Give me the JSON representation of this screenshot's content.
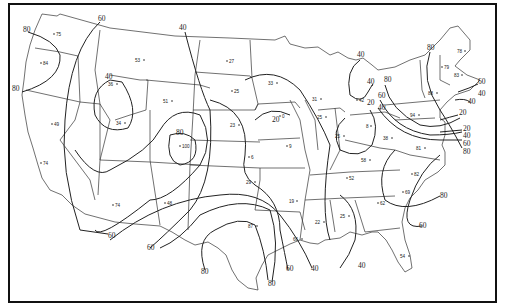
{
  "map": {
    "type": "isoline-map",
    "region": "Contiguous United States",
    "colors": {
      "background": "#ffffff",
      "lines": "#222222",
      "border": "#111111"
    },
    "isoline_labels": [
      {
        "text": "80",
        "x": 23,
        "y": 32
      },
      {
        "text": "60",
        "x": 102,
        "y": 21
      },
      {
        "text": "80",
        "x": 15,
        "y": 91
      },
      {
        "text": "40",
        "x": 183,
        "y": 30
      },
      {
        "text": "40",
        "x": 108,
        "y": 79
      },
      {
        "text": "80",
        "x": 180,
        "y": 135
      },
      {
        "text": "20",
        "x": 275,
        "y": 122
      },
      {
        "text": "40",
        "x": 360,
        "y": 57
      },
      {
        "text": "40",
        "x": 370,
        "y": 84
      },
      {
        "text": "20",
        "x": 370,
        "y": 105
      },
      {
        "text": "40",
        "x": 381,
        "y": 110
      },
      {
        "text": "60",
        "x": 381,
        "y": 98
      },
      {
        "text": "80",
        "x": 387,
        "y": 82
      },
      {
        "text": "80",
        "x": 430,
        "y": 50
      },
      {
        "text": "60",
        "x": 479,
        "y": 84
      },
      {
        "text": "40",
        "x": 480,
        "y": 96
      },
      {
        "text": "40",
        "x": 470,
        "y": 104
      },
      {
        "text": "20",
        "x": 459,
        "y": 115
      },
      {
        "text": "20",
        "x": 463,
        "y": 130
      },
      {
        "text": "40",
        "x": 463,
        "y": 137
      },
      {
        "text": "60",
        "x": 463,
        "y": 145
      },
      {
        "text": "80",
        "x": 463,
        "y": 153
      },
      {
        "text": "80",
        "x": 442,
        "y": 196
      },
      {
        "text": "60",
        "x": 111,
        "y": 237
      },
      {
        "text": "60",
        "x": 151,
        "y": 249
      },
      {
        "text": "80",
        "x": 203,
        "y": 272
      },
      {
        "text": "80",
        "x": 272,
        "y": 284
      },
      {
        "text": "60",
        "x": 289,
        "y": 270
      },
      {
        "text": "40",
        "x": 314,
        "y": 270
      },
      {
        "text": "40",
        "x": 361,
        "y": 266
      },
      {
        "text": "60",
        "x": 422,
        "y": 226
      }
    ],
    "station_values": [
      {
        "value": "75",
        "x": 56,
        "y": 35
      },
      {
        "value": "84",
        "x": 43,
        "y": 64
      },
      {
        "value": "53",
        "x": 137,
        "y": 61
      },
      {
        "value": "27",
        "x": 228,
        "y": 62
      },
      {
        "value": "36",
        "x": 110,
        "y": 85
      },
      {
        "value": "51",
        "x": 165,
        "y": 102
      },
      {
        "value": "25",
        "x": 233,
        "y": 92
      },
      {
        "value": "33",
        "x": 270,
        "y": 84
      },
      {
        "value": "31",
        "x": 315,
        "y": 99
      },
      {
        "value": "42",
        "x": 358,
        "y": 100
      },
      {
        "value": "49",
        "x": 54,
        "y": 124
      },
      {
        "value": "34",
        "x": 119,
        "y": 123
      },
      {
        "value": "23",
        "x": 233,
        "y": 125
      },
      {
        "value": "0",
        "x": 282,
        "y": 116
      },
      {
        "value": "25",
        "x": 320,
        "y": 117
      },
      {
        "value": "8",
        "x": 369,
        "y": 126
      },
      {
        "value": "94",
        "x": 413,
        "y": 115
      },
      {
        "value": "88",
        "x": 431,
        "y": 93
      },
      {
        "value": "79",
        "x": 444,
        "y": 67
      },
      {
        "value": "83",
        "x": 457,
        "y": 75
      },
      {
        "value": "78",
        "x": 459,
        "y": 51
      },
      {
        "value": "100",
        "x": 182,
        "y": 146
      },
      {
        "value": "6",
        "x": 251,
        "y": 157
      },
      {
        "value": "9",
        "x": 288,
        "y": 146
      },
      {
        "value": "25",
        "x": 338,
        "y": 136
      },
      {
        "value": "38",
        "x": 387,
        "y": 138
      },
      {
        "value": "81",
        "x": 419,
        "y": 148
      },
      {
        "value": "58",
        "x": 364,
        "y": 160
      },
      {
        "value": "74",
        "x": 43,
        "y": 163
      },
      {
        "value": "29",
        "x": 250,
        "y": 182
      },
      {
        "value": "52",
        "x": 349,
        "y": 178
      },
      {
        "value": "82",
        "x": 414,
        "y": 174
      },
      {
        "value": "69",
        "x": 405,
        "y": 192
      },
      {
        "value": "74",
        "x": 115,
        "y": 205
      },
      {
        "value": "48",
        "x": 167,
        "y": 203
      },
      {
        "value": "19",
        "x": 292,
        "y": 201
      },
      {
        "value": "25",
        "x": 343,
        "y": 216
      },
      {
        "value": "22",
        "x": 318,
        "y": 222
      },
      {
        "value": "62",
        "x": 380,
        "y": 203
      },
      {
        "value": "87",
        "x": 251,
        "y": 226
      },
      {
        "value": "66",
        "x": 296,
        "y": 239
      },
      {
        "value": "54",
        "x": 404,
        "y": 256
      }
    ]
  }
}
